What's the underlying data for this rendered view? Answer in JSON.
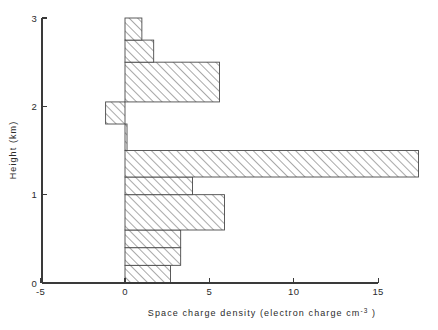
{
  "figure": {
    "background_color": "#ffffff",
    "axis_color": "#3a3a3a",
    "bar_edge_color": "#4a4a4a",
    "hatch_color": "#8c8c8c"
  },
  "axes": {
    "x_title": "Space charge density  (electron charge   cm",
    "x_title_sup": "-3",
    "x_title_tail": " )",
    "y_title": "Height  (km)",
    "x_ticks": [
      {
        "value": -5,
        "label": "-5"
      },
      {
        "value": 0,
        "label": "0"
      },
      {
        "value": 5,
        "label": "5"
      },
      {
        "value": 10,
        "label": "10"
      },
      {
        "value": 15,
        "label": "15"
      }
    ],
    "y_ticks": [
      {
        "value": 0,
        "label": "0"
      },
      {
        "value": 1,
        "label": "1"
      },
      {
        "value": 2,
        "label": "2"
      },
      {
        "value": 3,
        "label": "3"
      }
    ]
  },
  "chart_data": {
    "type": "bar",
    "orientation": "horizontal",
    "title": "",
    "xlabel": "Space charge density (electron charge cm^-3)",
    "ylabel": "Height (km)",
    "xlim": [
      -5,
      15
    ],
    "ylim": [
      0,
      3
    ],
    "grid": false,
    "legend": null,
    "bars": [
      {
        "y_bottom": 0.0,
        "y_top": 0.2,
        "value": 2.7
      },
      {
        "y_bottom": 0.2,
        "y_top": 0.4,
        "value": 3.3
      },
      {
        "y_bottom": 0.4,
        "y_top": 0.6,
        "value": 3.3
      },
      {
        "y_bottom": 0.6,
        "y_top": 1.0,
        "value": 5.9
      },
      {
        "y_bottom": 1.0,
        "y_top": 1.2,
        "value": 4.0
      },
      {
        "y_bottom": 1.2,
        "y_top": 1.5,
        "value": 17.4
      },
      {
        "y_bottom": 1.5,
        "y_top": 1.8,
        "value": 0.12
      },
      {
        "y_bottom": 1.8,
        "y_top": 2.05,
        "value": -1.15
      },
      {
        "y_bottom": 2.05,
        "y_top": 2.5,
        "value": 5.6
      },
      {
        "y_bottom": 2.5,
        "y_top": 2.75,
        "value": 1.7
      },
      {
        "y_bottom": 2.75,
        "y_top": 3.0,
        "value": 1.0
      }
    ]
  },
  "geometry": {
    "x_origin_px": 125,
    "px_per_x_unit": 16.87,
    "y_zero_px": 283,
    "px_per_km": 88.33,
    "x_axis_left_px": 42,
    "x_axis_right_px": 378,
    "y_axis_x_px": 42,
    "y_axis_top_px": 18
  }
}
